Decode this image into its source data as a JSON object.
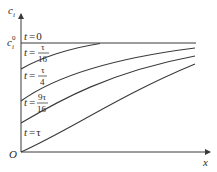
{
  "figure": {
    "y_axis_label": "c",
    "y_axis_sub": "i",
    "x_axis_label": "x",
    "origin_label": "O",
    "c0_label": "c",
    "c0_sup": "0",
    "c0_sub": "i",
    "curves": [
      {
        "label_t": "t",
        "eq": "=",
        "value": "0"
      },
      {
        "label_t": "t",
        "eq": "=",
        "numerator": "τ",
        "denominator": "16"
      },
      {
        "label_t": "t",
        "eq": "=",
        "numerator": "τ",
        "denominator": "4"
      },
      {
        "label_t": "t",
        "eq": "=",
        "numerator": "9τ",
        "denominator": "16"
      },
      {
        "label_t": "t",
        "eq": "=",
        "value": "τ"
      }
    ]
  },
  "colors": {
    "line": "#3a3a3a",
    "text": "#2a2a2a",
    "background": "#ffffff"
  }
}
